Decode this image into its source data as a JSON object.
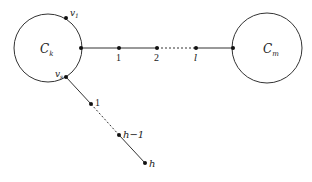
{
  "diagram": {
    "type": "graph",
    "colors": {
      "stroke": "#333333",
      "node": "#111111",
      "background": "#ffffff"
    },
    "cycles": [
      {
        "id": "Ck",
        "label": "C",
        "subscript": "k",
        "cx": 48,
        "cy": 48,
        "r": 34
      },
      {
        "id": "Cm",
        "label": "C",
        "subscript": "m",
        "cx": 267,
        "cy": 48,
        "r": 35
      }
    ],
    "cycle_vertices": [
      {
        "id": "v1",
        "label": "v",
        "subscript": "1",
        "x": 66,
        "y": 18
      },
      {
        "id": "vs",
        "label": "v",
        "subscript": "s",
        "x": 66,
        "y": 77
      }
    ],
    "path_top": {
      "nodes": [
        {
          "label": "",
          "x": 81,
          "y": 48
        },
        {
          "label": "1",
          "x": 119,
          "y": 48
        },
        {
          "label": "2",
          "x": 157,
          "y": 48
        },
        {
          "label": "l",
          "x": 196,
          "y": 48
        },
        {
          "label": "",
          "x": 233,
          "y": 48
        }
      ],
      "dashed_segment": [
        2,
        3
      ]
    },
    "path_bottom": {
      "nodes": [
        {
          "label": "",
          "x": 66,
          "y": 77
        },
        {
          "label": "1",
          "x": 91,
          "y": 104
        },
        {
          "label": "h-1",
          "x": 119,
          "y": 135
        },
        {
          "label": "h",
          "x": 145,
          "y": 163
        }
      ],
      "dashed_segment": [
        1,
        2
      ]
    }
  },
  "labels": {
    "ck_main": "C",
    "ck_sub": "k",
    "cm_main": "C",
    "cm_sub": "m",
    "v1_main": "v",
    "v1_sub": "1",
    "vs_main": "v",
    "vs_sub": "s",
    "top_1": "1",
    "top_2": "2",
    "top_l": "l",
    "bot_1": "1",
    "bot_h1": "h−1",
    "bot_h": "h"
  }
}
